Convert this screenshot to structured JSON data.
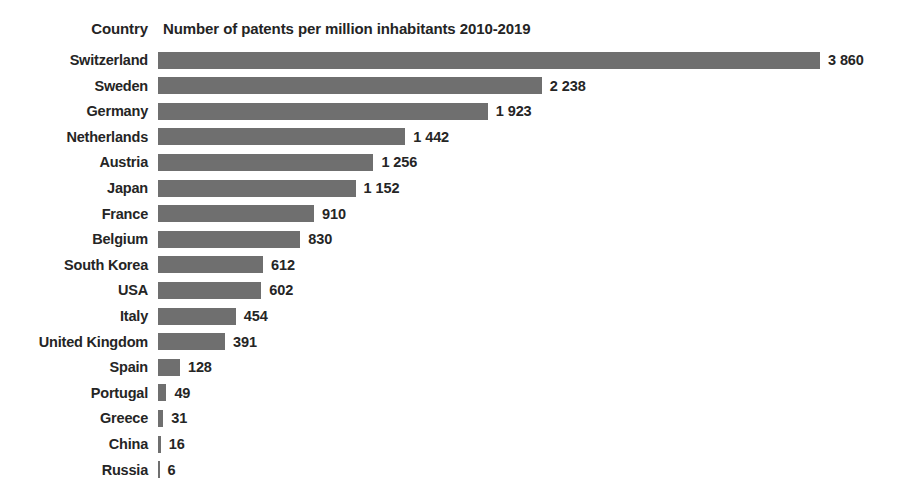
{
  "header": {
    "country_label": "Country",
    "title": "Number of patents per million inhabitants 2010-2019"
  },
  "style": {
    "bar_color": "#6f6f6f",
    "text_color": "#252525",
    "background": "#ffffff"
  },
  "chart_data": {
    "type": "bar",
    "orientation": "horizontal",
    "title": "Number of patents per million inhabitants 2010-2019",
    "xlabel": "",
    "ylabel": "Country",
    "grid": false,
    "legend": null,
    "xlim": [
      0,
      3860
    ],
    "value_separator": "space",
    "categories": [
      "Switzerland",
      "Sweden",
      "Germany",
      "Netherlands",
      "Austria",
      "Japan",
      "France",
      "Belgium",
      "South Korea",
      "USA",
      "Italy",
      "United Kingdom",
      "Spain",
      "Portugal",
      "Greece",
      "China",
      "Russia"
    ],
    "values": [
      3860,
      2238,
      1923,
      1442,
      1256,
      1152,
      910,
      830,
      612,
      602,
      454,
      391,
      128,
      49,
      31,
      16,
      6
    ],
    "value_labels": [
      "3 860",
      "2 238",
      "1 923",
      "1 442",
      "1 256",
      "1 152",
      "910",
      "830",
      "612",
      "602",
      "454",
      "391",
      "128",
      "49",
      "31",
      "16",
      "6"
    ]
  }
}
